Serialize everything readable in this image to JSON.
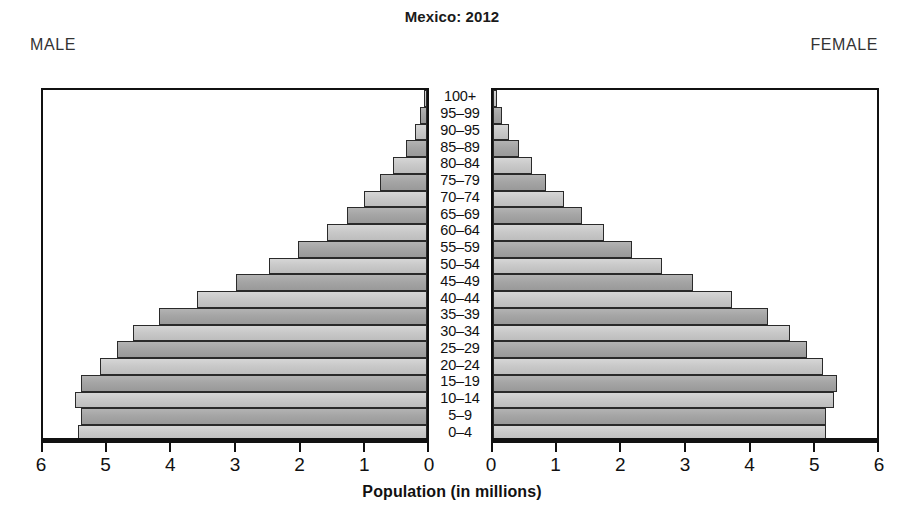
{
  "header": {
    "title": "Mexico: 2012",
    "male_label": "MALE",
    "female_label": "FEMALE"
  },
  "axis": {
    "x_title": "Population (in millions)",
    "male_ticks": [
      "6",
      "5",
      "4",
      "3",
      "2",
      "1",
      "0"
    ],
    "female_ticks": [
      "0",
      "1",
      "2",
      "3",
      "4",
      "5",
      "6"
    ]
  },
  "colors": {
    "bar_light": "#c9c9c9",
    "bar_dark": "#a5a5a5",
    "border": "#2a2a2a",
    "frame": "#111111",
    "text": "#111111",
    "background": "#ffffff"
  },
  "chart_data": {
    "type": "bar",
    "title": "Mexico: 2012",
    "subtitle": "",
    "xlabel": "Population (in millions)",
    "ylabel": "",
    "xlim": [
      0,
      6
    ],
    "grid": false,
    "legend_position": "none",
    "orientation": "horizontal-diverging",
    "categories": [
      "100+",
      "95–99",
      "90–95",
      "85–89",
      "80–84",
      "75–79",
      "70–74",
      "65–69",
      "60–64",
      "55–59",
      "50–54",
      "45–49",
      "40–44",
      "35–39",
      "30–34",
      "25–29",
      "20–24",
      "15–19",
      "10–14",
      "5–9",
      "0–4"
    ],
    "series": [
      {
        "name": "MALE",
        "side": "left",
        "values": [
          0.04,
          0.11,
          0.19,
          0.33,
          0.52,
          0.72,
          0.98,
          1.23,
          1.55,
          1.99,
          2.45,
          2.95,
          3.55,
          4.15,
          4.55,
          4.8,
          5.05,
          5.35,
          5.45,
          5.35,
          5.4
        ]
      },
      {
        "name": "FEMALE",
        "side": "right",
        "values": [
          0.06,
          0.14,
          0.24,
          0.4,
          0.6,
          0.82,
          1.1,
          1.38,
          1.72,
          2.15,
          2.62,
          3.1,
          3.7,
          4.25,
          4.6,
          4.85,
          5.1,
          5.32,
          5.28,
          5.15,
          5.15
        ]
      }
    ]
  }
}
